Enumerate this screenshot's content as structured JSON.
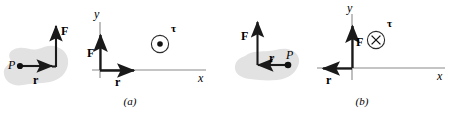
{
  "figure": {
    "colors": {
      "ink": "#1a1a1a",
      "blob_fill": "#e2e2e2",
      "axis": "#5a5a5a",
      "vector": "#1a1a1a"
    },
    "panels": [
      {
        "id": "a",
        "caption": "(a)",
        "body_diagram": {
          "point_label": "P",
          "r_label": "r",
          "f_label": "F",
          "r_direction": "right",
          "f_direction": "up",
          "blob_name": "rigid-body-blob"
        },
        "axes_diagram": {
          "y_axis_label": "y",
          "x_axis_label": "x",
          "r_label": "r",
          "f_label": "F",
          "r_direction": "right",
          "f_direction": "up",
          "torque_label": "τ",
          "torque_symbol": "dot",
          "torque_meaning": "out-of-page"
        }
      },
      {
        "id": "b",
        "caption": "(b)",
        "body_diagram": {
          "point_label": "P",
          "r_label": "r",
          "f_label": "F",
          "r_direction": "left",
          "f_direction": "up",
          "blob_name": "rigid-body-blob"
        },
        "axes_diagram": {
          "y_axis_label": "y",
          "x_axis_label": "x",
          "r_label": "r",
          "f_label": "F",
          "r_direction": "left",
          "f_direction": "up",
          "torque_label": "τ",
          "torque_symbol": "cross",
          "torque_meaning": "into-page"
        }
      }
    ]
  }
}
